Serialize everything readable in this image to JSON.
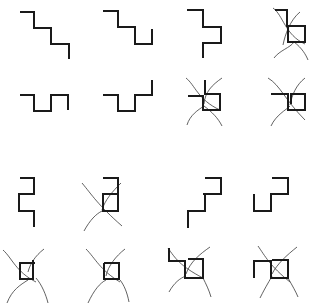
{
  "diagram": {
    "colors": {
      "background": "#ffffff",
      "strong_line": "#1a1a1a",
      "thin_curve": "#3a3a3a"
    },
    "figures": [
      {
        "id": "r1c1",
        "row": 1,
        "col": 1,
        "kind": "staircase",
        "crossed": false,
        "path": "M20,12 H34 V28 H51 V44 H69 V59"
      },
      {
        "id": "r1c2",
        "row": 1,
        "col": 2,
        "kind": "staircase-hook",
        "crossed": false,
        "path": "M103,11 H118 V27 H135 V44 H152 V29"
      },
      {
        "id": "r1c3",
        "row": 1,
        "col": 3,
        "kind": "staircase-notch",
        "crossed": false,
        "path": "M187,10 H203 V27 H221 V43 H203 V58"
      },
      {
        "id": "r1c4",
        "row": 1,
        "col": 4,
        "kind": "box-with-curves",
        "crossed": true,
        "path": "M275,10 H287 V26 H305 V42 H288 V26",
        "curves": [
          "M273,8 C283,15 285,35 305,44",
          "M300,12 C290,20 285,35 283,45",
          "M274,58 C280,50 290,48 294,42",
          "M294,42 C302,48 306,55 308,60"
        ]
      },
      {
        "id": "r2c1",
        "row": 2,
        "col": 1,
        "kind": "crenellation",
        "crossed": false,
        "path": "M20,95 H34 V111 H51 V95 H68 V110"
      },
      {
        "id": "r2c2",
        "row": 2,
        "col": 2,
        "kind": "crenellation-up",
        "crossed": false,
        "path": "M103,95 H118 V111 H135 V95 H152 V80"
      },
      {
        "id": "r2c3",
        "row": 2,
        "col": 3,
        "kind": "box-with-curves",
        "crossed": true,
        "path": "M188,96 H203 V110 H220 V94 H205 V80",
        "curves": [
          "M186,78 C195,85 198,100 220,110",
          "M222,78 C212,85 205,92 204,104",
          "M187,125 C190,115 198,110 204,106",
          "M204,106 C212,112 218,118 222,126"
        ]
      },
      {
        "id": "r2c4",
        "row": 2,
        "col": 4,
        "kind": "box-with-curves",
        "crossed": true,
        "path": "M271,94 H288 V110 H305 V94 H291 V104",
        "curves": [
          "M268,78 C280,85 285,100 305,120",
          "M305,78 C296,85 292,95 290,105",
          "M271,126 C276,115 286,110 290,106"
        ]
      },
      {
        "id": "r3c1",
        "row": 3,
        "col": 1,
        "kind": "s-shape",
        "crossed": false,
        "path": "M20,178 H34 V194 H19 V211 H34 V227"
      },
      {
        "id": "r3c2",
        "row": 3,
        "col": 2,
        "kind": "s-shape-with-curves",
        "crossed": true,
        "path": "M103,178 H118 V194 H103 V211 H118 V194",
        "curves": [
          "M82,183 C92,195 98,205 122,226",
          "M121,183 C112,192 105,200 102,210",
          "M84,231 C90,220 96,214 102,211"
        ]
      },
      {
        "id": "r3c3",
        "row": 3,
        "col": 3,
        "kind": "staircase-up",
        "crossed": false,
        "path": "M188,228 V211 H205 V194 H203 H221 V178 H205"
      },
      {
        "id": "r3c4",
        "row": 3,
        "col": 4,
        "kind": "staircase-cup",
        "crossed": false,
        "path": "M254,194 V211 H271 V194 H288 V178 H272"
      },
      {
        "id": "r4c1",
        "row": 4,
        "col": 1,
        "kind": "box-with-curves",
        "crossed": true,
        "path": "M20,263 H33 V260 V279 H20 V263 H35",
        "curves": [
          "M3,250 C12,258 16,272 36,282",
          "M44,249 C35,256 30,264 28,272",
          "M7,303 C12,290 20,285 28,280",
          "M36,278 C42,285 46,295 48,303"
        ]
      },
      {
        "id": "r4c2",
        "row": 4,
        "col": 2,
        "kind": "box-with-curves",
        "crossed": true,
        "path": "M104,263 H119 V279 H104 V263",
        "curves": [
          "M86,249 C95,258 100,270 120,282",
          "M125,249 C116,256 108,266 106,276",
          "M88,303 C94,290 100,283 106,280",
          "M120,280 C124,285 127,292 129,302"
        ]
      },
      {
        "id": "r4c3",
        "row": 4,
        "col": 3,
        "kind": "box-with-curves",
        "crossed": true,
        "path": "M169,248 V261 H185 V278 H203 V259 H188",
        "curves": [
          "M168,248 C175,258 180,266 203,278",
          "M210,247 C200,254 190,262 186,274",
          "M169,292 C174,283 180,278 186,276",
          "M203,278 C206,284 209,290 211,297"
        ]
      },
      {
        "id": "r4c4",
        "row": 4,
        "col": 4,
        "kind": "box-with-curves",
        "crossed": true,
        "path": "M254,278 V261 H271 V278 H288 V260 H272",
        "curves": [
          "M258,246 C265,256 270,266 290,282",
          "M297,247 C287,255 277,264 272,274",
          "M260,298 C266,286 270,280 272,276",
          "M288,278 C292,285 296,292 298,297"
        ]
      }
    ]
  }
}
